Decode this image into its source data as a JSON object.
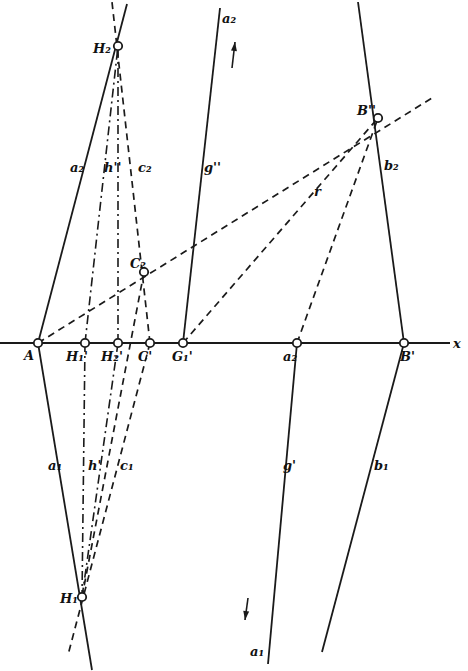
{
  "figure": {
    "type": "descriptive-geometry construction",
    "axis": {
      "label": "x",
      "y": 343,
      "x_start": 0,
      "x_end": 450
    },
    "points": [
      {
        "id": "A",
        "label": "A",
        "x": 38,
        "y": 343,
        "lx": 24,
        "ly": 360
      },
      {
        "id": "H1p",
        "label": "H₁'",
        "x": 85,
        "y": 343,
        "lx": 66,
        "ly": 361
      },
      {
        "id": "H2p",
        "label": "H₂'",
        "x": 118,
        "y": 343,
        "lx": 101,
        "ly": 361
      },
      {
        "id": "Cp",
        "label": "C'",
        "x": 150,
        "y": 343,
        "lx": 138,
        "ly": 361
      },
      {
        "id": "G1p",
        "label": "G₁'",
        "x": 183,
        "y": 343,
        "lx": 172,
        "ly": 361
      },
      {
        "id": "a2p",
        "label": "a₂",
        "x": 297,
        "y": 343,
        "lx": 283,
        "ly": 361
      },
      {
        "id": "Bp",
        "label": "B'",
        "x": 404,
        "y": 343,
        "lx": 400,
        "ly": 361
      },
      {
        "id": "H2",
        "label": "H₂",
        "x": 118,
        "y": 46,
        "lx": 93,
        "ly": 53
      },
      {
        "id": "C2",
        "label": "C₂",
        "x": 144,
        "y": 272,
        "lx": 130,
        "ly": 268
      },
      {
        "id": "B2",
        "label": "B''",
        "x": 378,
        "y": 118,
        "lx": 357,
        "ly": 115
      },
      {
        "id": "H1",
        "label": "H₁",
        "x": 82,
        "y": 597,
        "lx": 60,
        "ly": 603
      }
    ],
    "line_labels": [
      {
        "id": "a2-top",
        "label": "a₂",
        "x": 222,
        "y": 23
      },
      {
        "id": "a2-line",
        "label": "a₂",
        "x": 70,
        "y": 172
      },
      {
        "id": "h2",
        "label": "h''",
        "x": 104,
        "y": 172
      },
      {
        "id": "c2",
        "label": "c₂",
        "x": 138,
        "y": 172
      },
      {
        "id": "g2",
        "label": "g''",
        "x": 204,
        "y": 172
      },
      {
        "id": "r",
        "label": "r",
        "x": 314,
        "y": 196
      },
      {
        "id": "b2",
        "label": "b₂",
        "x": 384,
        "y": 170
      },
      {
        "id": "a1",
        "label": "a₁",
        "x": 48,
        "y": 470
      },
      {
        "id": "h1",
        "label": "h'",
        "x": 88,
        "y": 470
      },
      {
        "id": "c1",
        "label": "c₁",
        "x": 120,
        "y": 470
      },
      {
        "id": "g1",
        "label": "g'",
        "x": 283,
        "y": 470
      },
      {
        "id": "b1",
        "label": "b₁",
        "x": 374,
        "y": 470
      },
      {
        "id": "a1-bottom",
        "label": "a₁",
        "x": 250,
        "y": 656
      },
      {
        "id": "x-axis",
        "label": "x",
        "x": 453,
        "y": 348
      }
    ],
    "segments": {
      "solid": [
        {
          "name": "line-a2",
          "x1": 38,
          "y1": 343,
          "x2": 127,
          "y2": 4
        },
        {
          "name": "line-a1",
          "x1": 38,
          "y1": 343,
          "x2": 92,
          "y2": 670
        },
        {
          "name": "line-b2",
          "x1": 404,
          "y1": 343,
          "x2": 358,
          "y2": 2
        },
        {
          "name": "line-b1",
          "x1": 404,
          "y1": 343,
          "x2": 322,
          "y2": 652
        },
        {
          "name": "line-g2",
          "x1": 183,
          "y1": 343,
          "x2": 220,
          "y2": 8
        },
        {
          "name": "line-g1",
          "x1": 297,
          "y1": 343,
          "x2": 268,
          "y2": 664
        }
      ],
      "dashed": [
        {
          "name": "line-r",
          "x1": 38,
          "y1": 343,
          "x2": 432,
          "y2": 98
        },
        {
          "name": "line-c2",
          "x1": 150,
          "y1": 343,
          "x2": 112,
          "y2": 2
        },
        {
          "name": "line-c1",
          "x1": 150,
          "y1": 343,
          "x2": 68,
          "y2": 655
        },
        {
          "name": "line-g1p-b2",
          "x1": 183,
          "y1": 343,
          "x2": 378,
          "y2": 118
        },
        {
          "name": "line-a2p-b2",
          "x1": 297,
          "y1": 343,
          "x2": 378,
          "y2": 118
        },
        {
          "name": "line-c2-h1",
          "x1": 144,
          "y1": 272,
          "x2": 82,
          "y2": 597
        }
      ],
      "dashdot": [
        {
          "name": "line-h2",
          "x1": 85,
          "y1": 343,
          "x2": 118,
          "y2": 46
        },
        {
          "name": "line-h1",
          "x1": 85,
          "y1": 343,
          "x2": 82,
          "y2": 597
        },
        {
          "name": "line-h2p-h2",
          "x1": 118,
          "y1": 343,
          "x2": 118,
          "y2": 46
        },
        {
          "name": "line-h2p-h1",
          "x1": 118,
          "y1": 343,
          "x2": 82,
          "y2": 597
        }
      ]
    },
    "arrows": [
      {
        "name": "arrow-up",
        "x1": 232,
        "y1": 68,
        "x2": 235,
        "y2": 42
      },
      {
        "name": "arrow-down",
        "x1": 248,
        "y1": 598,
        "x2": 245,
        "y2": 620
      }
    ]
  }
}
